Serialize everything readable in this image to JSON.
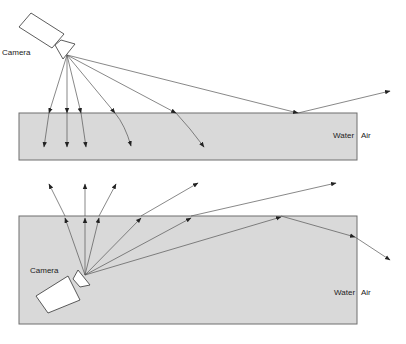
{
  "diagram": {
    "top_panel": {
      "camera_label": "Camera",
      "water_label": "Water",
      "air_label": "Air"
    },
    "bottom_panel": {
      "camera_label": "Camera",
      "water_label": "Water",
      "air_label": "Air"
    },
    "colors": {
      "water_fill": "#d9d9d9",
      "water_stroke": "#6e6e6e",
      "ray": "#555555",
      "arrowhead": "#222222"
    }
  }
}
